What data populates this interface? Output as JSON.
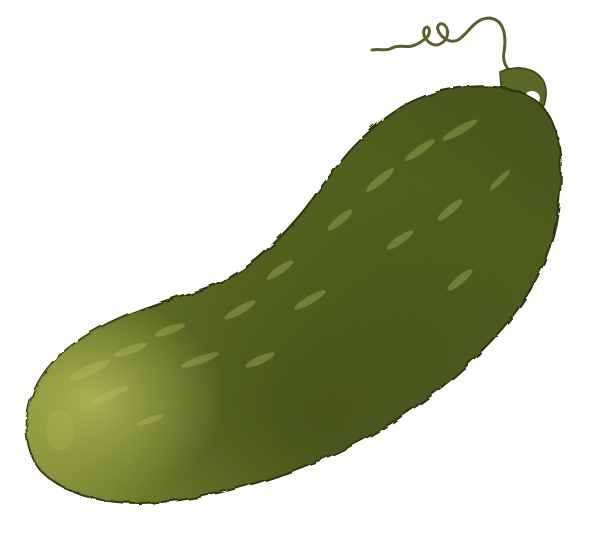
{
  "image": {
    "subject": "pickle",
    "description": "Illustration of a green dill pickle with a curly stem tendril at the top",
    "background_color": "#ffffff",
    "colors": {
      "body_dark": "#3f4a14",
      "body_mid": "#5c6a22",
      "body_light": "#8c9a3c",
      "highlight": "#b8c068",
      "stem": "#55622a",
      "outline": "#2e3510"
    }
  }
}
